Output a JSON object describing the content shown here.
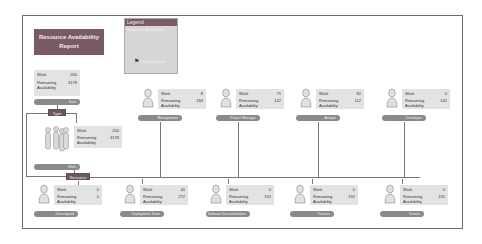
{
  "title": "Resource Availability Report",
  "legend": {
    "header": "Legend",
    "subtitle": "Resource Availability",
    "flag_label": "Overallocated",
    "flag_icon": "flag-icon"
  },
  "labels": {
    "work": "Work",
    "remaining": "Remaining Availability"
  },
  "connectors": {
    "type": "Type",
    "resource": "Resource"
  },
  "total": {
    "label": "Total",
    "work": "200",
    "remaining": "3178"
  },
  "work_group": {
    "label": "Work",
    "work": "200",
    "remaining": "3178"
  },
  "top_row": [
    {
      "name": "Management",
      "work": "8",
      "remaining": "184"
    },
    {
      "name": "Project Manager",
      "work": "75",
      "remaining": "122"
    },
    {
      "name": "Analyst",
      "work": "82",
      "remaining": "112"
    },
    {
      "name": "Developer",
      "work": "0",
      "remaining": "142"
    }
  ],
  "bottom_row": [
    {
      "name": "Unassigned",
      "work": "0",
      "remaining": "0"
    },
    {
      "name": "Deployment Team",
      "work": "40",
      "remaining": "272"
    },
    {
      "name": "Software Documentation",
      "work": "0",
      "remaining": "192"
    },
    {
      "name": "Trainers",
      "work": "0",
      "remaining": "192"
    },
    {
      "name": "Testers",
      "work": "0",
      "remaining": "192"
    }
  ]
}
